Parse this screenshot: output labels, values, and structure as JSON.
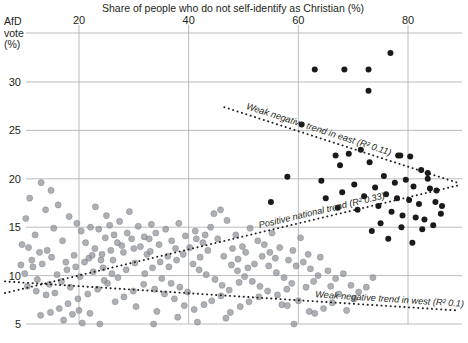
{
  "chart_data": {
    "type": "scatter",
    "title": "Share of people who do not self-identify as Christian (%)",
    "xlabel": "Share of people who do not self-identify as Christian (%)",
    "ylabel": "AfD vote (%)",
    "ylabel_lines": [
      "AfD",
      "vote",
      "(%)"
    ],
    "xlim": [
      6,
      89
    ],
    "ylim": [
      3.5,
      35.5
    ],
    "xticks": [
      20,
      40,
      60,
      80
    ],
    "xtick_labels": [
      "20",
      "40",
      "60",
      "80"
    ],
    "yticks": [
      5,
      10,
      15,
      20,
      25,
      30
    ],
    "ytick_labels": [
      "5",
      "10",
      "15",
      "20",
      "25",
      "30"
    ],
    "grid": true,
    "legend": "none",
    "colors": {
      "west_points": "#8d9199",
      "east_points": "#1a1a1a",
      "grid": "#a9abb0",
      "trend": "#231f20",
      "background": "#ffffff"
    },
    "series": [
      {
        "name": "West districts",
        "marker": "circle",
        "color": "#8d9199",
        "points": [
          [
            13.1,
            19.6
          ],
          [
            14.9,
            18.8
          ],
          [
            11.0,
            18.0
          ],
          [
            16.2,
            17.3
          ],
          [
            13.9,
            16.8
          ],
          [
            10.3,
            15.9
          ],
          [
            18.2,
            16.1
          ],
          [
            15.4,
            14.9
          ],
          [
            19.6,
            15.4
          ],
          [
            12.0,
            14.2
          ],
          [
            17.0,
            13.6
          ],
          [
            9.6,
            13.2
          ],
          [
            14.2,
            12.6
          ],
          [
            20.4,
            14.6
          ],
          [
            22.1,
            15.0
          ],
          [
            21.2,
            13.4
          ],
          [
            23.6,
            14.8
          ],
          [
            24.8,
            13.9
          ],
          [
            22.9,
            12.8
          ],
          [
            25.6,
            15.2
          ],
          [
            26.4,
            14.2
          ],
          [
            27.8,
            13.1
          ],
          [
            24.2,
            12.2
          ],
          [
            21.8,
            11.8
          ],
          [
            19.1,
            12.1
          ],
          [
            17.6,
            11.4
          ],
          [
            15.0,
            11.9
          ],
          [
            13.3,
            11.2
          ],
          [
            11.6,
            10.9
          ],
          [
            10.1,
            10.2
          ],
          [
            12.4,
            9.6
          ],
          [
            14.6,
            9.1
          ],
          [
            16.8,
            9.4
          ],
          [
            18.4,
            8.8
          ],
          [
            20.2,
            9.9
          ],
          [
            22.6,
            10.4
          ],
          [
            24.4,
            10.8
          ],
          [
            26.2,
            11.6
          ],
          [
            28.1,
            12.4
          ],
          [
            29.6,
            13.8
          ],
          [
            30.8,
            15.1
          ],
          [
            31.9,
            14.0
          ],
          [
            33.2,
            15.3
          ],
          [
            34.6,
            13.2
          ],
          [
            32.4,
            12.2
          ],
          [
            30.2,
            11.3
          ],
          [
            28.6,
            10.6
          ],
          [
            27.1,
            9.8
          ],
          [
            25.2,
            9.2
          ],
          [
            23.4,
            8.6
          ],
          [
            21.6,
            8.1
          ],
          [
            19.8,
            7.6
          ],
          [
            18.0,
            7.1
          ],
          [
            16.4,
            6.6
          ],
          [
            14.8,
            6.2
          ],
          [
            13.0,
            5.9
          ],
          [
            17.2,
            5.4
          ],
          [
            20.6,
            5.1
          ],
          [
            23.8,
            5.0
          ],
          [
            35.8,
            14.8
          ],
          [
            36.9,
            13.6
          ],
          [
            38.2,
            15.4
          ],
          [
            39.4,
            14.1
          ],
          [
            37.6,
            12.8
          ],
          [
            36.2,
            12.0
          ],
          [
            34.8,
            11.4
          ],
          [
            33.4,
            10.8
          ],
          [
            32.0,
            10.2
          ],
          [
            35.1,
            9.7
          ],
          [
            36.8,
            9.2
          ],
          [
            38.4,
            8.8
          ],
          [
            39.8,
            8.3
          ],
          [
            41.2,
            14.6
          ],
          [
            42.6,
            13.4
          ],
          [
            44.0,
            15.0
          ],
          [
            45.3,
            13.8
          ],
          [
            43.5,
            12.6
          ],
          [
            42.1,
            11.9
          ],
          [
            40.8,
            11.2
          ],
          [
            41.9,
            10.6
          ],
          [
            43.2,
            10.1
          ],
          [
            44.8,
            9.6
          ],
          [
            46.1,
            9.0
          ],
          [
            47.4,
            8.5
          ],
          [
            45.9,
            7.9
          ],
          [
            44.2,
            7.4
          ],
          [
            42.8,
            7.0
          ],
          [
            41.0,
            6.5
          ],
          [
            39.2,
            6.9
          ],
          [
            37.4,
            7.6
          ],
          [
            35.6,
            8.1
          ],
          [
            33.8,
            8.6
          ],
          [
            31.8,
            9.1
          ],
          [
            29.9,
            8.4
          ],
          [
            28.2,
            7.8
          ],
          [
            26.6,
            7.3
          ],
          [
            30.4,
            6.8
          ],
          [
            34.2,
            6.3
          ],
          [
            38.0,
            5.7
          ],
          [
            41.6,
            5.2
          ],
          [
            48.6,
            14.2
          ],
          [
            49.8,
            13.0
          ],
          [
            51.2,
            14.9
          ],
          [
            52.6,
            13.6
          ],
          [
            50.4,
            12.4
          ],
          [
            49.0,
            11.7
          ],
          [
            47.8,
            11.1
          ],
          [
            48.9,
            10.5
          ],
          [
            50.2,
            9.9
          ],
          [
            51.6,
            9.4
          ],
          [
            53.0,
            8.9
          ],
          [
            54.4,
            8.4
          ],
          [
            52.8,
            7.8
          ],
          [
            51.0,
            7.3
          ],
          [
            49.4,
            6.8
          ],
          [
            47.6,
            6.2
          ],
          [
            53.8,
            13.2
          ],
          [
            55.2,
            14.4
          ],
          [
            56.6,
            12.9
          ],
          [
            55.8,
            11.8
          ],
          [
            54.6,
            11.0
          ],
          [
            56.0,
            10.3
          ],
          [
            57.4,
            9.8
          ],
          [
            58.8,
            9.2
          ],
          [
            57.9,
            8.6
          ],
          [
            56.2,
            8.0
          ],
          [
            59.0,
            12.6
          ],
          [
            60.4,
            13.9
          ],
          [
            61.8,
            12.2
          ],
          [
            60.9,
            11.4
          ],
          [
            62.2,
            10.7
          ],
          [
            63.6,
            10.0
          ],
          [
            62.8,
            9.4
          ],
          [
            61.4,
            8.8
          ],
          [
            64.0,
            11.9
          ],
          [
            65.4,
            10.5
          ],
          [
            66.8,
            9.7
          ],
          [
            65.9,
            8.9
          ],
          [
            68.2,
            10.2
          ],
          [
            69.6,
            9.0
          ],
          [
            71.0,
            8.3
          ],
          [
            67.4,
            8.1
          ],
          [
            44.6,
            16.4
          ],
          [
            45.8,
            16.8
          ],
          [
            47.0,
            15.7
          ],
          [
            29.2,
            16.6
          ],
          [
            27.4,
            15.6
          ],
          [
            25.0,
            16.2
          ],
          [
            23.0,
            17.1
          ],
          [
            12.8,
            12.4
          ],
          [
            11.4,
            11.6
          ],
          [
            10.8,
            12.9
          ],
          [
            9.4,
            11.1
          ],
          [
            16.0,
            10.1
          ],
          [
            17.8,
            10.6
          ],
          [
            19.4,
            10.9
          ],
          [
            21.0,
            11.4
          ],
          [
            22.4,
            12.1
          ],
          [
            24.0,
            11.6
          ],
          [
            25.8,
            12.6
          ],
          [
            27.0,
            13.4
          ],
          [
            28.8,
            14.4
          ],
          [
            26.0,
            10.2
          ],
          [
            24.6,
            9.5
          ],
          [
            31.2,
            13.0
          ],
          [
            32.8,
            13.8
          ],
          [
            30.0,
            12.8
          ],
          [
            33.0,
            12.5
          ],
          [
            34.0,
            14.4
          ],
          [
            36.4,
            10.9
          ],
          [
            37.8,
            11.6
          ],
          [
            39.0,
            12.2
          ],
          [
            40.2,
            12.9
          ],
          [
            41.4,
            13.8
          ],
          [
            43.0,
            14.2
          ],
          [
            46.4,
            12.0
          ],
          [
            48.0,
            12.8
          ],
          [
            49.2,
            9.3
          ],
          [
            50.8,
            10.8
          ],
          [
            52.0,
            11.2
          ],
          [
            53.4,
            12.0
          ],
          [
            54.8,
            12.4
          ],
          [
            58.2,
            11.6
          ],
          [
            59.6,
            11.0
          ],
          [
            46.8,
            5.6
          ],
          [
            59.2,
            5.0
          ],
          [
            33.6,
            5.0
          ],
          [
            62.0,
            6.3
          ],
          [
            63.0,
            6.1
          ],
          [
            64.6,
            6.6
          ],
          [
            57.0,
            7.0
          ],
          [
            60.0,
            7.4
          ],
          [
            58.0,
            6.9
          ],
          [
            70.2,
            7.6
          ],
          [
            72.4,
            8.8
          ],
          [
            73.6,
            9.8
          ],
          [
            68.8,
            6.4
          ],
          [
            66.2,
            7.2
          ],
          [
            15.6,
            8.2
          ],
          [
            14.0,
            8.0
          ],
          [
            12.2,
            8.4
          ],
          [
            10.6,
            8.9
          ],
          [
            18.8,
            6.0
          ],
          [
            20.0,
            6.4
          ],
          [
            22.0,
            6.1
          ]
        ]
      },
      {
        "name": "East districts",
        "marker": "circle",
        "color": "#1a1a1a",
        "points": [
          [
            76.8,
            33.0
          ],
          [
            63.0,
            31.3
          ],
          [
            68.4,
            31.3
          ],
          [
            72.8,
            31.3
          ],
          [
            72.8,
            29.1
          ],
          [
            60.6,
            25.6
          ],
          [
            66.8,
            22.4
          ],
          [
            69.2,
            22.6
          ],
          [
            71.4,
            23.0
          ],
          [
            73.0,
            21.7
          ],
          [
            78.2,
            22.4
          ],
          [
            78.6,
            22.4
          ],
          [
            80.4,
            22.3
          ],
          [
            67.6,
            21.4
          ],
          [
            82.4,
            20.9
          ],
          [
            83.6,
            20.6
          ],
          [
            83.6,
            20.0
          ],
          [
            75.6,
            20.3
          ],
          [
            64.2,
            19.8
          ],
          [
            77.6,
            19.6
          ],
          [
            79.6,
            19.9
          ],
          [
            81.0,
            19.2
          ],
          [
            84.0,
            19.0
          ],
          [
            85.2,
            18.8
          ],
          [
            74.0,
            19.1
          ],
          [
            70.2,
            19.4
          ],
          [
            76.0,
            18.4
          ],
          [
            78.0,
            18.0
          ],
          [
            80.2,
            17.8
          ],
          [
            82.0,
            17.4
          ],
          [
            85.0,
            17.6
          ],
          [
            86.2,
            17.2
          ],
          [
            72.0,
            18.2
          ],
          [
            68.0,
            18.6
          ],
          [
            65.0,
            18.0
          ],
          [
            74.6,
            17.2
          ],
          [
            77.0,
            16.6
          ],
          [
            79.0,
            16.2
          ],
          [
            81.4,
            16.0
          ],
          [
            83.0,
            15.8
          ],
          [
            86.0,
            16.4
          ],
          [
            70.8,
            16.8
          ],
          [
            67.2,
            17.0
          ],
          [
            75.0,
            15.4
          ],
          [
            78.8,
            15.0
          ],
          [
            82.6,
            14.8
          ],
          [
            84.6,
            15.2
          ],
          [
            73.4,
            14.6
          ],
          [
            76.4,
            13.8
          ],
          [
            80.8,
            13.4
          ],
          [
            58.0,
            20.2
          ],
          [
            55.0,
            17.6
          ]
        ]
      }
    ],
    "trendlines": [
      {
        "name": "east",
        "label": "Weak negative trend in east (R² 0.11)",
        "r_squared": 0.11,
        "style": "dotted",
        "x0": 46.5,
        "y0": 27.4,
        "x1": 89.0,
        "y1": 19.6
      },
      {
        "name": "national",
        "label": "Positive national trend (R² 0.33)",
        "r_squared": 0.33,
        "style": "dotted",
        "x0": 6.5,
        "y0": 8.2,
        "x1": 89.0,
        "y1": 19.3
      },
      {
        "name": "west",
        "label": "Weak negative trend in west (R² 0.1)",
        "r_squared": 0.1,
        "style": "dotted",
        "x0": 6.5,
        "y0": 9.4,
        "x1": 89.0,
        "y1": 6.4
      }
    ]
  }
}
